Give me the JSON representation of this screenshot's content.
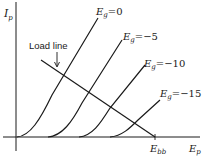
{
  "diagram": {
    "y_axis_label": "I",
    "y_axis_sub": "p",
    "x_axis_label": "E",
    "x_axis_sub": "p",
    "supply_label": "E",
    "supply_sub": "bb",
    "load_line_label": "Load line",
    "curves": [
      {
        "name": "E",
        "sub": "g",
        "value": "=0"
      },
      {
        "name": "E",
        "sub": "g",
        "value": "=−5"
      },
      {
        "name": "E",
        "sub": "g",
        "value": "=−10"
      },
      {
        "name": "E",
        "sub": "g",
        "value": "=−15"
      }
    ],
    "line_color": "#1a1a1a",
    "background": "#ffffff"
  }
}
